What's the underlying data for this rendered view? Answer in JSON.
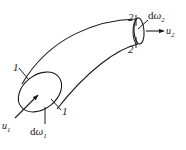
{
  "figure": {
    "kind": "stream-tube-diagram",
    "title": "",
    "background_color": "#ffffff",
    "line_color": "#1a1a1a",
    "width": 186,
    "height": 150
  },
  "labels": {
    "section_1_upper": "1",
    "section_1_lower": "1",
    "section_2_upper": "2",
    "section_2_lower": "2",
    "velocity_1": "u",
    "velocity_1_sub": "1",
    "velocity_2": "u",
    "velocity_2_sub": "2",
    "area_1_prefix": "d",
    "area_1_symbol": "ω",
    "area_1_sub": "1",
    "area_2_prefix": "d",
    "area_2_symbol": "ω",
    "area_2_sub": "2"
  },
  "geometry": {
    "inlet_ellipse": {
      "cx": 40,
      "cy": 92,
      "rx": 24,
      "ry": 17,
      "rotation": -38
    },
    "outlet_ellipse": {
      "cx": 139,
      "cy": 31,
      "rx": 5,
      "ry": 13,
      "rotation": -4
    },
    "upper_wall": "M 22,84 C 50,36 98,20 136,19",
    "lower_wall": "M 57,109 C 86,72 116,49 138,44",
    "inlet_velocity_arrow": {
      "x1": 15,
      "y1": 118,
      "x2": 38,
      "y2": 95
    },
    "outlet_velocity_arrow": {
      "x1": 146,
      "y1": 31,
      "x2": 166,
      "y2": 31
    },
    "inlet_area_leader": {
      "x1": 45,
      "y1": 124,
      "x2": 45,
      "y2": 108
    },
    "outlet_area_leader": {
      "x1": 147,
      "y1": 19,
      "x2": 138,
      "y2": 28
    },
    "section_1_tick_upper": {
      "x1": 19,
      "y1": 68,
      "x2": 27,
      "y2": 79
    },
    "section_1_tick_lower": {
      "x1": 52,
      "y1": 100,
      "x2": 60,
      "y2": 109
    },
    "section_2_tick_upper": {
      "x1": 136,
      "y1": 16,
      "x2": 136,
      "y2": 26
    },
    "section_2_tick_lower": {
      "x1": 136,
      "y1": 38,
      "x2": 136,
      "y2": 48
    }
  }
}
